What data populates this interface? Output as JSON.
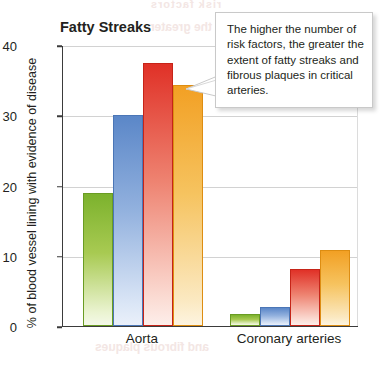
{
  "chart_data": {
    "type": "bar",
    "title": "Fatty Streaks",
    "xlabel": "",
    "ylabel": "% of blood vessel lining with evidence of disease",
    "categories": [
      "Aorta",
      "Coronary arteries"
    ],
    "ylim": [
      0,
      40
    ],
    "yticks": [
      0,
      10,
      20,
      30,
      40
    ],
    "grid": true,
    "legend": "none",
    "series": [
      {
        "name": "0 risk factors",
        "color": "#7cb22d",
        "values": [
          19.0,
          1.7
        ]
      },
      {
        "name": "1 risk factor",
        "color": "#5b87c8",
        "values": [
          30.0,
          2.7
        ]
      },
      {
        "name": "2 risk factors",
        "color": "#e03127",
        "values": [
          37.5,
          8.1
        ]
      },
      {
        "name": "3 risk factors",
        "color": "#f2a024",
        "values": [
          34.3,
          10.8
        ]
      }
    ],
    "annotations": [
      {
        "name": "callout",
        "text": "The higher the number of risk factors, the greater the extent of fatty streaks and fibrous plaques in critical arteries."
      }
    ]
  },
  "ghost_text": {
    "top": "risk factors",
    "sub": "per and the greater",
    "low": "and fibrous plaques"
  }
}
